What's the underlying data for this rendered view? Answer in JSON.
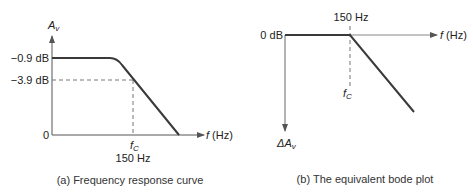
{
  "panel_a": {
    "y_axis_label_main": "A",
    "y_axis_label_sub": "v",
    "y_tick_top": "−0.9 dB",
    "y_tick_mid": "−3.9 dB",
    "y_tick_zero": "0",
    "x_axis_label_f": "f",
    "x_axis_label_unit": " (Hz)",
    "fc_label_main": "f",
    "fc_label_sub": "C",
    "fc_value": "150 Hz",
    "caption": "(a)  Frequency response curve"
  },
  "panel_b": {
    "y_tick_zero": "0 dB",
    "x_axis_label_f": "f",
    "x_axis_label_unit": " (Hz)",
    "fc_value": "150 Hz",
    "fc_label_main": "f",
    "fc_label_sub": "C",
    "y_axis_label_main": "ΔA",
    "y_axis_label_sub": "v",
    "caption": "(b)  The equivalent bode plot"
  },
  "colors": {
    "curve": "#3a3a3a",
    "axis": "#666666",
    "dashed": "#777777",
    "text": "#222222"
  }
}
